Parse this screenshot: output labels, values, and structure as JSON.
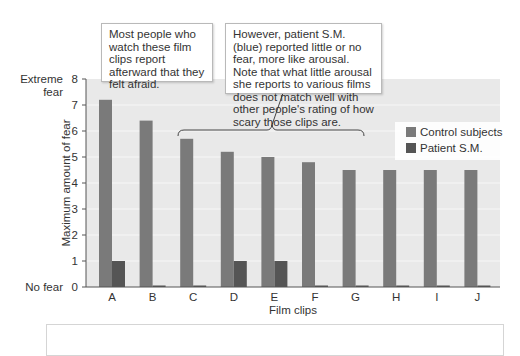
{
  "chart_data": {
    "type": "bar",
    "title": "",
    "xlabel": "Film clips",
    "ylabel": "Maximum amount of fear",
    "ylim": [
      0,
      8
    ],
    "yticks": [
      0,
      1,
      2,
      3,
      4,
      5,
      6,
      7,
      8
    ],
    "ytick_annotations": {
      "8": "Extreme fear",
      "0": "No fear"
    },
    "categories": [
      "A",
      "B",
      "C",
      "D",
      "E",
      "F",
      "G",
      "H",
      "I",
      "J"
    ],
    "series": [
      {
        "name": "Control subjects",
        "color": "#7a7a7a",
        "values": [
          7.2,
          6.4,
          5.7,
          5.2,
          5.0,
          4.8,
          4.5,
          4.5,
          4.5,
          4.5
        ]
      },
      {
        "name": "Patient S.M.",
        "color": "#555555",
        "values": [
          1.0,
          0.05,
          0.05,
          1.0,
          1.0,
          0.05,
          0.05,
          0.05,
          0.05,
          0.05
        ]
      }
    ],
    "grid": true,
    "legend_position": "upper right",
    "annotations": [
      "Most people who watch these film clips report afterward that they felt afraid.",
      "However, patient S.M. (blue) reported little or no fear, more like arousal. Note that what little arousal she reports to various films does not match well with other people's rating of how scary those clips are."
    ],
    "brace_span": [
      "C",
      "J"
    ]
  },
  "labels": {
    "extreme_fear_1": "Extreme",
    "extreme_fear_2": "fear",
    "no_fear": "No fear",
    "callout_1": "Most people who watch these film clips report afterward that they felt afraid.",
    "callout_2": "However, patient S.M. (blue) reported little or no fear, more like arousal. Note that what little arousal she reports to various films does not match well with other people's rating of how scary those clips are."
  },
  "colors": {
    "plot_bg": "#e9e9e9",
    "grid": "#f7f7f7",
    "axis": "#555555",
    "control": "#7a7a7a",
    "patient": "#555555"
  }
}
